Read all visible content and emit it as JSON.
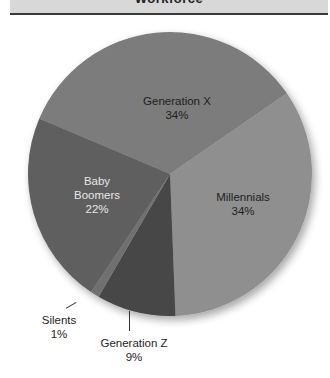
{
  "header": {
    "title": "Workforce"
  },
  "chart_data": {
    "type": "pie",
    "title": "Workforce",
    "start_angle_deg": 293,
    "direction": "clockwise",
    "slices": [
      {
        "label": "Generation X",
        "value": 34,
        "display": "34%",
        "color": "#7b7b7b"
      },
      {
        "label": "Millennials",
        "value": 34,
        "display": "34%",
        "color": "#8f8f8f"
      },
      {
        "label": "Generation Z",
        "value": 9,
        "display": "9%",
        "color": "#464646"
      },
      {
        "label": "Silents",
        "value": 1,
        "display": "1%",
        "color": "#707070"
      },
      {
        "label": "Baby Boomers",
        "value": 22,
        "display": "22%",
        "color": "#5f5f5f"
      }
    ],
    "legend": "none (labels on slices)"
  },
  "labels": {
    "gen_x": {
      "name": "Generation X",
      "pct": "34%"
    },
    "millennials": {
      "name": "Millennials",
      "pct": "34%"
    },
    "baby_boomers": {
      "line1": "Baby",
      "line2": "Boomers",
      "pct": "22%"
    },
    "silents": {
      "name": "Silents",
      "pct": "1%"
    },
    "gen_z": {
      "name": "Generation Z",
      "pct": "9%"
    }
  }
}
